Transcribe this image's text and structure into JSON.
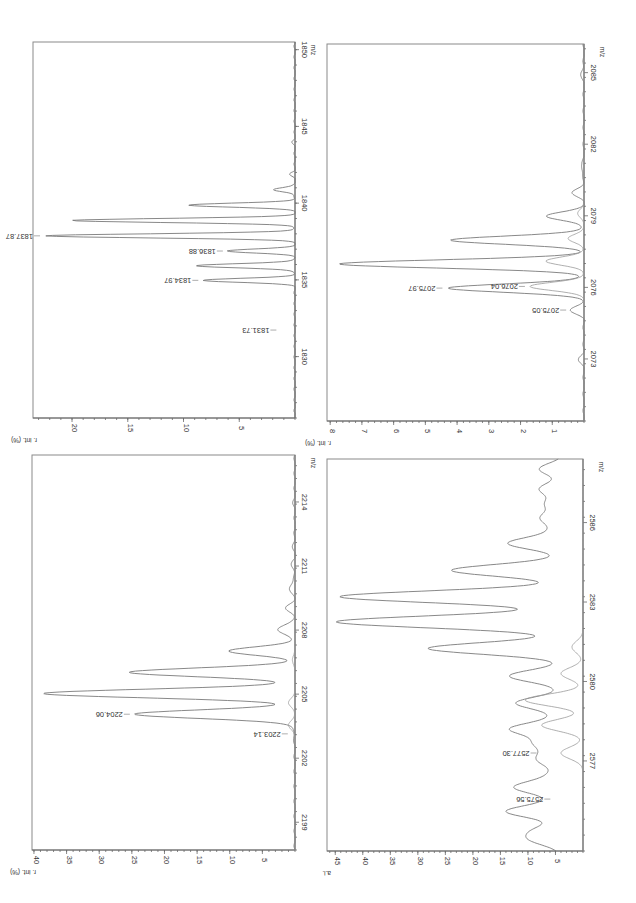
{
  "page": {
    "title": ""
  },
  "chart_data": [
    {
      "id": "panel-1830",
      "type": "line",
      "title": "",
      "xlabel": "m/z",
      "ylabel": "r. int. (%)",
      "xlim": [
        1826,
        1850.5
      ],
      "ylim": [
        0,
        23.5
      ],
      "xticks": [
        1830,
        1835,
        1840,
        1845,
        1850
      ],
      "yticks": [
        5,
        10,
        15,
        20
      ],
      "grid": false,
      "box": {
        "left": 33,
        "top": 42,
        "right": 295,
        "bottom": 418
      },
      "peak_width": 0.13,
      "series": [
        {
          "name": "spectrum",
          "peaks": [
            {
              "x": 1834.97,
              "y": 8.2
            },
            {
              "x": 1835.92,
              "y": 9.0
            },
            {
              "x": 1836.88,
              "y": 6.0
            },
            {
              "x": 1837.87,
              "y": 22.4
            },
            {
              "x": 1838.87,
              "y": 20.0
            },
            {
              "x": 1839.87,
              "y": 9.5
            },
            {
              "x": 1840.87,
              "y": 2.0
            },
            {
              "x": 1841.9,
              "y": 0.4
            },
            {
              "x": 1844.0,
              "y": 0.2
            }
          ]
        }
      ],
      "annotations": [
        {
          "label": "1831.73",
          "x": 1831.73,
          "y": 1.2
        },
        {
          "label": "1834.97",
          "x": 1834.97,
          "y": 8.2
        },
        {
          "label": "1836.88",
          "x": 1836.88,
          "y": 6.0
        },
        {
          "label": "1837.87",
          "x": 1837.87,
          "y": 22.4
        }
      ]
    },
    {
      "id": "panel-2073",
      "type": "line",
      "title": "",
      "xlabel": "m/z",
      "ylabel": "r. int. (%)",
      "xlim": [
        2070.4,
        2086.2
      ],
      "ylim": [
        0,
        8.1
      ],
      "xticks": [
        2073,
        2076,
        2079,
        2082,
        2085
      ],
      "yticks": [
        1,
        2,
        3,
        4,
        5,
        6,
        7,
        8
      ],
      "grid": false,
      "box": {
        "left": 327,
        "top": 44,
        "right": 584,
        "bottom": 421
      },
      "peak_width": 0.17,
      "series": [
        {
          "name": "spectrum",
          "peaks": [
            {
              "x": 2073.0,
              "y": 0.15
            },
            {
              "x": 2075.05,
              "y": 0.4
            },
            {
              "x": 2075.97,
              "y": 4.3
            },
            {
              "x": 2076.98,
              "y": 7.7
            },
            {
              "x": 2077.98,
              "y": 4.2
            },
            {
              "x": 2078.98,
              "y": 1.2
            },
            {
              "x": 2079.98,
              "y": 0.35
            },
            {
              "x": 2081.0,
              "y": 0.1
            },
            {
              "x": 2085.0,
              "y": 0.1
            }
          ]
        },
        {
          "name": "overlay",
          "peaks": [
            {
              "x": 2076.04,
              "y": 1.7
            },
            {
              "x": 2077.1,
              "y": 1.2
            },
            {
              "x": 2078.05,
              "y": 0.5
            },
            {
              "x": 2079.1,
              "y": 0.2
            }
          ]
        }
      ],
      "annotations": [
        {
          "label": "2075.05",
          "x": 2075.05,
          "y": 0.4
        },
        {
          "label": "2075.97",
          "x": 2075.97,
          "y": 4.3
        },
        {
          "label": "2076.04",
          "x": 2076.04,
          "y": 1.7
        }
      ]
    },
    {
      "id": "panel-2199",
      "type": "line",
      "title": "",
      "xlabel": "m/z",
      "ylabel": "r. int. (%)",
      "xlim": [
        2197.7,
        2216.2
      ],
      "ylim": [
        0,
        40.3
      ],
      "xticks": [
        2199,
        2202,
        2205,
        2208,
        2211,
        2214
      ],
      "yticks": [
        5,
        10,
        15,
        20,
        25,
        30,
        35,
        40
      ],
      "grid": false,
      "box": {
        "left": 32,
        "top": 455,
        "right": 295,
        "bottom": 850
      },
      "peak_width": 0.2,
      "series": [
        {
          "name": "spectrum",
          "peaks": [
            {
              "x": 2203.14,
              "y": 0.3
            },
            {
              "x": 2204.06,
              "y": 24.5
            },
            {
              "x": 2205.03,
              "y": 38.5
            },
            {
              "x": 2206.02,
              "y": 25.5
            },
            {
              "x": 2207.02,
              "y": 10.0
            },
            {
              "x": 2208.02,
              "y": 2.8
            },
            {
              "x": 2209.02,
              "y": 1.3
            },
            {
              "x": 2210.0,
              "y": 0.9
            },
            {
              "x": 2211.0,
              "y": 0.5
            },
            {
              "x": 2212.0,
              "y": 0.3
            },
            {
              "x": 2214.0,
              "y": 0.2
            }
          ]
        },
        {
          "name": "overlay",
          "peaks": [
            {
              "x": 2203.55,
              "y": 1.0
            },
            {
              "x": 2204.6,
              "y": 1.0
            },
            {
              "x": 2206.6,
              "y": 0.4
            }
          ]
        }
      ],
      "annotations": [
        {
          "label": "2203.14",
          "x": 2203.14,
          "y": 0.3
        },
        {
          "label": "2204.06",
          "x": 2204.06,
          "y": 24.5
        }
      ]
    },
    {
      "id": "panel-2577",
      "type": "line",
      "title": "",
      "xlabel": "m/z",
      "ylabel": "a.i.",
      "xlim": [
        2573.6,
        2588.4
      ],
      "ylim": [
        0,
        46.5
      ],
      "xticks": [
        2577,
        2580,
        2583,
        2586
      ],
      "yticks": [
        5,
        10,
        15,
        20,
        25,
        30,
        35,
        40,
        45
      ],
      "grid": false,
      "box": {
        "left": 327,
        "top": 459,
        "right": 583,
        "bottom": 851
      },
      "peak_width": 0.22,
      "baseline_offset": 4,
      "series": [
        {
          "name": "spectrum",
          "peaks": [
            {
              "x": 2574.0,
              "y": 5.0
            },
            {
              "x": 2574.4,
              "y": 4.5
            },
            {
              "x": 2575.1,
              "y": 10.0
            },
            {
              "x": 2575.56,
              "y": 1.0
            },
            {
              "x": 2576.0,
              "y": 8.5
            },
            {
              "x": 2576.5,
              "y": 2.0
            },
            {
              "x": 2577.0,
              "y": 3.0
            },
            {
              "x": 2577.3,
              "y": 2.5
            },
            {
              "x": 2577.7,
              "y": 4.0
            },
            {
              "x": 2578.2,
              "y": 9.0
            },
            {
              "x": 2578.7,
              "y": 1.5
            },
            {
              "x": 2579.2,
              "y": 8.0
            },
            {
              "x": 2580.2,
              "y": 9.5
            },
            {
              "x": 2581.25,
              "y": 24.0
            },
            {
              "x": 2582.25,
              "y": 41.0
            },
            {
              "x": 2583.2,
              "y": 40.0
            },
            {
              "x": 2584.2,
              "y": 20.0
            },
            {
              "x": 2585.2,
              "y": 9.5
            },
            {
              "x": 2585.7,
              "y": 2.0
            },
            {
              "x": 2586.2,
              "y": 3.5
            },
            {
              "x": 2586.7,
              "y": 2.5
            },
            {
              "x": 2587.25,
              "y": 4.0
            },
            {
              "x": 2588.0,
              "y": 4.0
            }
          ]
        },
        {
          "name": "overlay",
          "peaks": [
            {
              "x": 2577.3,
              "y": 4.0
            },
            {
              "x": 2578.35,
              "y": 7.5
            },
            {
              "x": 2579.3,
              "y": 10.5
            },
            {
              "x": 2580.3,
              "y": 4.0
            },
            {
              "x": 2581.3,
              "y": 2.0
            }
          ]
        }
      ],
      "annotations": [
        {
          "label": "2575.56",
          "x": 2575.56,
          "y": 5.0
        },
        {
          "label": "2577.30",
          "x": 2577.3,
          "y": 7.5
        }
      ]
    }
  ]
}
